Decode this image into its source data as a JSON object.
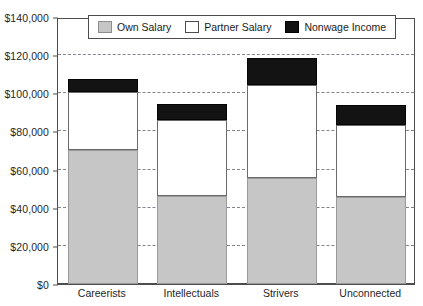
{
  "chart_data": {
    "type": "bar",
    "stacked": true,
    "title": "",
    "subtitle": "",
    "xlabel": "",
    "ylabel": "",
    "categories": [
      "Careerists",
      "Intellectuals",
      "Strivers",
      "Unconnected"
    ],
    "series": [
      {
        "name": "Own Salary",
        "color": "#c6c6c6",
        "values": [
          70500,
          46000,
          55700,
          45500
        ]
      },
      {
        "name": "Partner Salary",
        "color": "#ffffff",
        "values": [
          30000,
          40000,
          48800,
          38000
        ]
      },
      {
        "name": "Nonwage Income",
        "color": "#111111",
        "values": [
          7000,
          8500,
          14000,
          10500
        ]
      }
    ],
    "totals": [
      107500,
      94500,
      118500,
      94000
    ],
    "ylim": [
      0,
      140000
    ],
    "ytick_step": 20000,
    "ytick_labels": [
      "$0",
      "$20,000",
      "$40,000",
      "$60,000",
      "$80,000",
      "$100,000",
      "$120,000",
      "$140,000"
    ],
    "ytick_values": [
      0,
      20000,
      40000,
      60000,
      80000,
      100000,
      120000,
      140000
    ],
    "grid": true,
    "grid_style": "dashed-horizontal",
    "legend_position": "top-inside"
  },
  "legend": {
    "items": [
      {
        "label": "Own Salary",
        "swatch": "legend-swatch-own-salary"
      },
      {
        "label": "Partner Salary",
        "swatch": "legend-swatch-partner-salary"
      },
      {
        "label": "Nonwage Income",
        "swatch": "legend-swatch-nonwage-income"
      }
    ]
  }
}
